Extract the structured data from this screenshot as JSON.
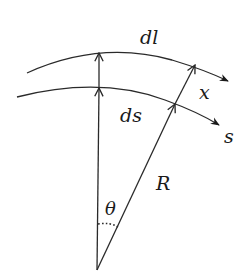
{
  "diagram": {
    "type": "curvilinear-coordinate-geometry",
    "labels": {
      "outer_arc": "dl",
      "inner_arc": "ds",
      "offset": "x",
      "curve": "s",
      "radius": "R",
      "angle": "θ"
    },
    "colors": {
      "line": "#2a2a2a",
      "text": "#1a1a1a",
      "background": "#ffffff"
    }
  }
}
